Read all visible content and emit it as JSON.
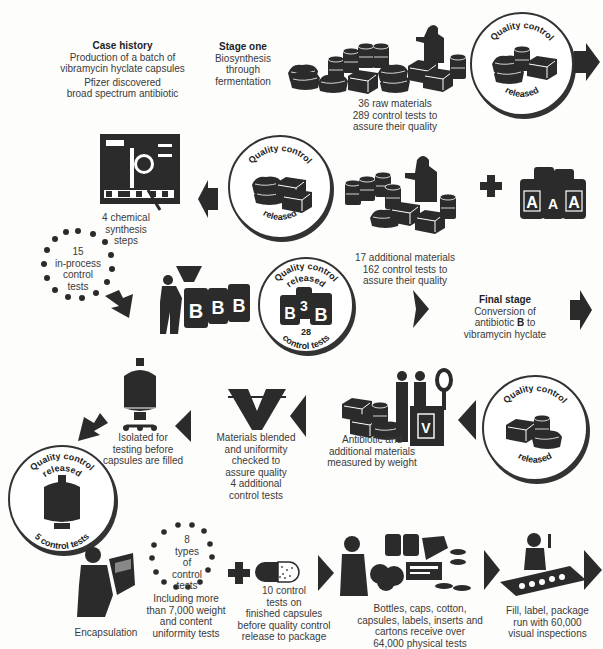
{
  "intro": {
    "title": "Case history",
    "line1": "Production of a batch of",
    "line2": "vibramycin hyclate capsules",
    "line3": "Pfizer discovered",
    "line4": "broad spectrum antibiotic"
  },
  "stage_one": {
    "title": "Stage one",
    "line1": "Biosynthesis",
    "line2": "through",
    "line3": "fermentation"
  },
  "raw_materials": {
    "line1": "36 raw materials",
    "line2": "289 control tests to",
    "line3": "assure their quality"
  },
  "qc1": {
    "top": "Quality control",
    "bottom": "released"
  },
  "qc2": {
    "top": "Quality control",
    "bottom": "released"
  },
  "additional_materials": {
    "line1": "17 additional materials",
    "line2": "162 control tests to",
    "line3": "assure their quality"
  },
  "chem_synthesis": {
    "line1": "4 chemical",
    "line2": "synthesis",
    "line3": "steps"
  },
  "inprocess": {
    "count": "15",
    "line1": "in-process",
    "line2": "control",
    "line3": "tests"
  },
  "qc3": {
    "top": "Quality control",
    "middle": "released",
    "count": "28",
    "bottom": "control tests"
  },
  "final_stage": {
    "title": "Final stage",
    "line1": "Conversion of",
    "line2_pre": "antibiotic ",
    "line2_bold": "B",
    "line2_post": " to",
    "line3": "vibramycin hyclate"
  },
  "qc4": {
    "top": "Quality control",
    "bottom": "released"
  },
  "weighing": {
    "line1": "Antibiotic and",
    "line2": "additional materials",
    "line3": "measured by weight"
  },
  "blending": {
    "line1": "Materials blended",
    "line2": "and uniformity",
    "line3": "checked to",
    "line4": "assure quality",
    "line5": "4 additional",
    "line6": "control tests"
  },
  "isolated": {
    "line1": "Isolated for",
    "line2": "testing before",
    "line3": "capsules are filled"
  },
  "qc5": {
    "top": "Quality control",
    "middle": "released",
    "bottom": "5 control tests"
  },
  "encapsulation": {
    "label": "Encapsulation"
  },
  "types_tests": {
    "count": "8",
    "line1": "types",
    "line2": "of",
    "line3": "control",
    "line4": "tests",
    "desc1": "Including more",
    "desc2": "than 7,000 weight",
    "desc3": "and content",
    "desc4": "uniformity tests"
  },
  "capsule_tests": {
    "line1": "10 control",
    "line2": "tests on",
    "line3": "finished capsules",
    "line4": "before quality control",
    "line5": "release to package"
  },
  "packaging_materials": {
    "line1": "Bottles, caps, cotton,",
    "line2": "capsules, labels, inserts and",
    "line3": "cartons receive over",
    "line4": "64,000 physical tests"
  },
  "fill": {
    "line1": "Fill, label, package",
    "line2": "run with 60,000",
    "line3": "visual inspections"
  },
  "drum_letters": {
    "a": "A",
    "b": "B",
    "b3": "3"
  },
  "colors": {
    "ink": "#2b2b2b",
    "paper": "#fdfdfc",
    "text": "#3a3a3a"
  }
}
